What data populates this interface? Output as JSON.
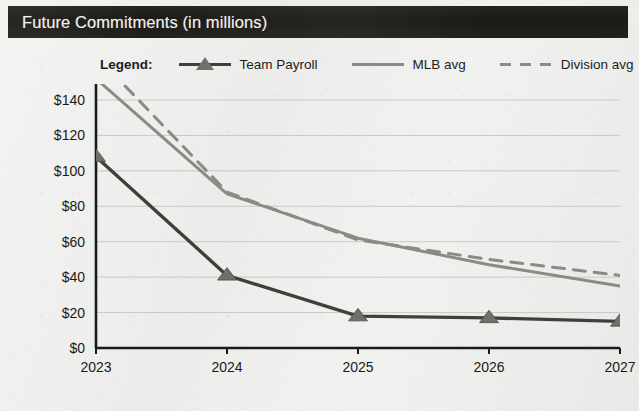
{
  "header": {
    "title": "Future Commitments (in millions)",
    "bar_color": "#201e19",
    "text_color": "#f2f1ee"
  },
  "legend": {
    "label": "Legend:",
    "entries": [
      {
        "name": "Team Payroll",
        "marker": "triangle-line",
        "color": "#3f3f3c",
        "style": "solid"
      },
      {
        "name": "MLB avg",
        "marker": "line",
        "color": "#8a8a86",
        "style": "solid"
      },
      {
        "name": "Division avg",
        "marker": "line",
        "color": "#8a8a86",
        "style": "dashed"
      }
    ]
  },
  "chart_data": {
    "type": "line",
    "title": "Future Commitments (in millions)",
    "xlabel": "",
    "ylabel": "",
    "x": [
      "2023",
      "2024",
      "2025",
      "2026",
      "2027"
    ],
    "categories": [
      "2023",
      "2024",
      "2025",
      "2026",
      "2027"
    ],
    "xtick_labels": [
      "2023",
      "2024",
      "2025",
      "2026",
      "2027"
    ],
    "ytick_labels": [
      "$0",
      "$20",
      "$40",
      "$60",
      "$80",
      "$100",
      "$120",
      "$140"
    ],
    "ytick_values": [
      0,
      20,
      40,
      60,
      80,
      100,
      120,
      140
    ],
    "ylim": [
      0,
      150
    ],
    "grid": true,
    "legend_position": "top",
    "series": [
      {
        "name": "Team Payroll",
        "values": [
          108,
          41,
          18,
          17,
          15
        ],
        "color": "#3f3f3c",
        "style": "solid",
        "marker": "triangle"
      },
      {
        "name": "MLB avg",
        "values": [
          152,
          87,
          62,
          47,
          35
        ],
        "color": "#8a8a86",
        "style": "solid",
        "marker": "none"
      },
      {
        "name": "Division avg",
        "values": [
          165,
          88,
          61,
          50,
          41
        ],
        "color": "#8a8a86",
        "style": "dashed",
        "marker": "none"
      }
    ]
  }
}
